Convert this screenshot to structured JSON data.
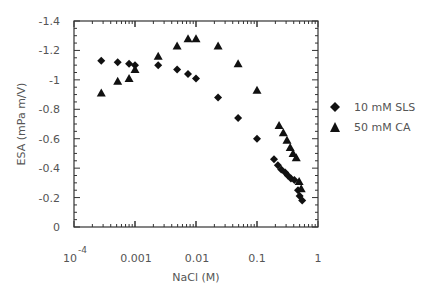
{
  "chart_data": {
    "type": "scatter",
    "title": "",
    "xlabel": "NaCl (M)",
    "ylabel": "ESA (mPa m/V)",
    "xscale": "log",
    "xlim": [
      0.0001,
      1
    ],
    "ylim": [
      0,
      -1.4
    ],
    "x_tick_labels": [
      "10^-4",
      "0.001",
      "0.01",
      "0.1",
      "1"
    ],
    "y_tick_labels": [
      "-1.4",
      "-1.2",
      "-1",
      "-0.8",
      "-0.6",
      "-0.4",
      "-0.2",
      "0"
    ],
    "grid": false,
    "legend_position": "right",
    "series": [
      {
        "name": "10 mM SLS",
        "marker": "diamond",
        "x": [
          0.00028,
          0.00052,
          0.0008,
          0.001,
          0.0024,
          0.0049,
          0.0074,
          0.01,
          0.023,
          0.049,
          0.1,
          0.19,
          0.22,
          0.25,
          0.29,
          0.32,
          0.36,
          0.41,
          0.47,
          0.5,
          0.55
        ],
        "y": [
          -1.13,
          -1.12,
          -1.11,
          -1.1,
          -1.1,
          -1.07,
          -1.04,
          -1.01,
          -0.88,
          -0.74,
          -0.6,
          -0.46,
          -0.42,
          -0.39,
          -0.37,
          -0.35,
          -0.33,
          -0.32,
          -0.25,
          -0.21,
          -0.18
        ]
      },
      {
        "name": "50 mM CA",
        "marker": "triangle",
        "x": [
          0.00028,
          0.00052,
          0.0008,
          0.001,
          0.0024,
          0.0049,
          0.0074,
          0.01,
          0.023,
          0.049,
          0.1,
          0.23,
          0.27,
          0.31,
          0.35,
          0.39,
          0.44,
          0.49,
          0.53
        ],
        "y": [
          -0.91,
          -0.99,
          -1.01,
          -1.07,
          -1.16,
          -1.23,
          -1.28,
          -1.28,
          -1.23,
          -1.11,
          -0.93,
          -0.69,
          -0.64,
          -0.59,
          -0.54,
          -0.5,
          -0.47,
          -0.31,
          -0.26
        ]
      }
    ]
  },
  "legend": {
    "items": [
      {
        "label": "10 mM SLS",
        "marker": "diamond"
      },
      {
        "label": "50 mM CA",
        "marker": "triangle"
      }
    ]
  },
  "axes": {
    "xlabel": "NaCl (M)",
    "ylabel": "ESA (mPa m/V)",
    "x_ticks": [
      {
        "base": "10",
        "exp": "-4"
      },
      {
        "text": "0.001"
      },
      {
        "text": "0.01"
      },
      {
        "text": "0.1"
      },
      {
        "text": "1"
      }
    ],
    "y_ticks": [
      "-1.4",
      "-1.2",
      "-1",
      "-0.8",
      "-0.6",
      "-0.4",
      "-0.2",
      "0"
    ]
  }
}
